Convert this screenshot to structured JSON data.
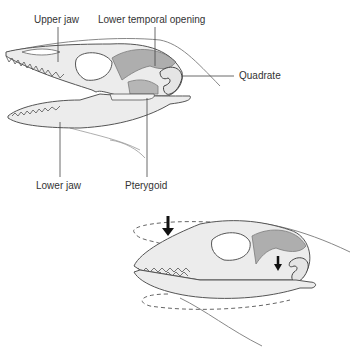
{
  "figure": {
    "top_panel": {
      "name": "open-jaw-skull",
      "labels": {
        "upper_jaw": "Upper jaw",
        "lower_temporal_opening": "Lower temporal opening",
        "quadrate": "Quadrate",
        "lower_jaw": "Lower jaw",
        "pterygoid": "Pterygoid"
      }
    },
    "bottom_panel": {
      "name": "closed-jaw-skull-kinesis",
      "arrows": [
        "downward-arrow-snout",
        "downward-arrow-quadrate"
      ],
      "motion_indicators": [
        "dashed-ellipse-upper",
        "dashed-ellipse-lower"
      ]
    },
    "colors": {
      "bone": "#ececec",
      "outline": "#555555",
      "shade": "#9a9a9a",
      "label_text": "#333333",
      "leader_line": "#444444"
    }
  }
}
